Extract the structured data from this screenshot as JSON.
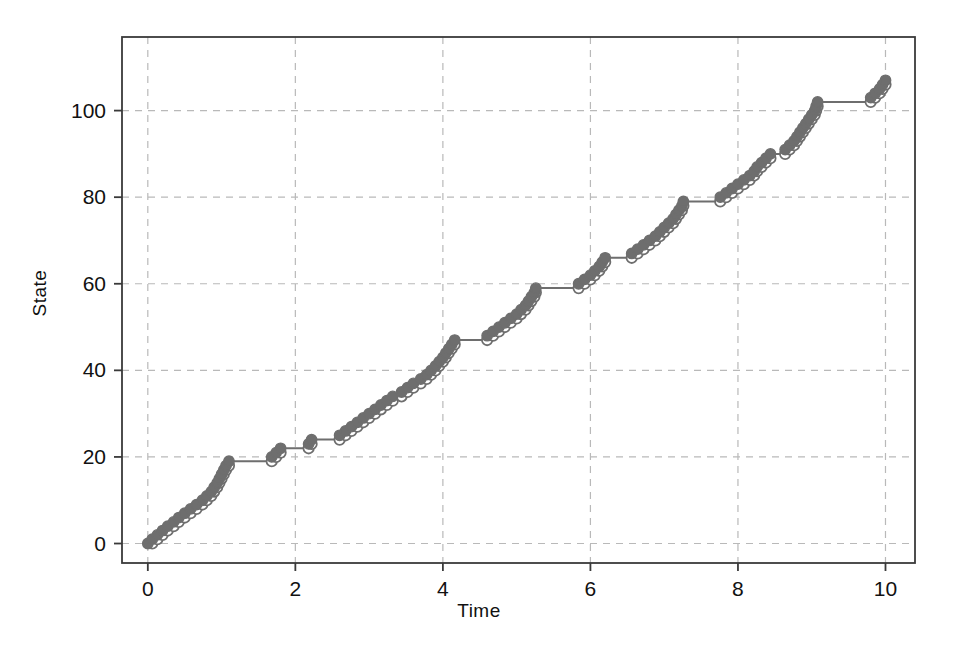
{
  "chart_data": {
    "type": "line",
    "subtype": "step-post",
    "title": "",
    "xlabel": "Time",
    "ylabel": "State",
    "xlim": [
      -0.35,
      10.4
    ],
    "ylim": [
      -4.5,
      117
    ],
    "xticks": [
      0,
      2,
      4,
      6,
      8,
      10
    ],
    "yticks": [
      0,
      20,
      40,
      60,
      80,
      100
    ],
    "xtick_labels": [
      "0",
      "2",
      "4",
      "6",
      "8",
      "10"
    ],
    "ytick_labels": [
      "0",
      "20",
      "40",
      "60",
      "80",
      "100"
    ],
    "grid": true,
    "grid_style": "dashed",
    "grid_color": "#b9b9b9",
    "frame_color": "#3a3a3a",
    "legend": null,
    "series": [
      {
        "name": "State",
        "color": "#6e6e6e",
        "marker_filled": "closed-circle",
        "marker_open": "open-circle",
        "line_width": 2,
        "x": [
          0.0,
          0.06,
          0.13,
          0.2,
          0.27,
          0.35,
          0.42,
          0.5,
          0.58,
          0.66,
          0.74,
          0.8,
          0.86,
          0.9,
          0.94,
          0.97,
          1.0,
          1.03,
          1.06,
          1.1,
          1.68,
          1.74,
          1.8,
          2.18,
          2.22,
          2.6,
          2.68,
          2.76,
          2.84,
          2.92,
          3.0,
          3.08,
          3.16,
          3.24,
          3.32,
          3.44,
          3.52,
          3.6,
          3.7,
          3.78,
          3.84,
          3.9,
          3.95,
          4.0,
          4.04,
          4.08,
          4.12,
          4.16,
          4.6,
          4.68,
          4.76,
          4.84,
          4.92,
          5.0,
          5.06,
          5.12,
          5.16,
          5.2,
          5.24,
          5.26,
          5.84,
          5.92,
          6.0,
          6.06,
          6.12,
          6.16,
          6.2,
          6.56,
          6.64,
          6.72,
          6.8,
          6.88,
          6.94,
          7.0,
          7.06,
          7.12,
          7.16,
          7.2,
          7.24,
          7.26,
          7.76,
          7.84,
          7.92,
          8.0,
          8.08,
          8.16,
          8.22,
          8.26,
          8.32,
          8.38,
          8.44,
          8.64,
          8.7,
          8.76,
          8.8,
          8.84,
          8.88,
          8.92,
          8.96,
          9.0,
          9.04,
          9.06,
          9.08,
          9.8,
          9.86,
          9.92,
          9.96,
          10.0
        ],
        "y": [
          0,
          1,
          2,
          3,
          4,
          5,
          6,
          7,
          8,
          9,
          10,
          11,
          12,
          13,
          14,
          15,
          16,
          17,
          18,
          19,
          20,
          21,
          22,
          23,
          24,
          25,
          26,
          27,
          28,
          29,
          30,
          31,
          32,
          33,
          34,
          35,
          36,
          37,
          38,
          39,
          40,
          41,
          42,
          43,
          44,
          45,
          46,
          47,
          48,
          49,
          50,
          51,
          52,
          53,
          54,
          55,
          56,
          57,
          58,
          59,
          60,
          61,
          62,
          63,
          64,
          65,
          66,
          67,
          68,
          69,
          70,
          71,
          72,
          73,
          74,
          75,
          76,
          77,
          78,
          79,
          80,
          81,
          82,
          83,
          84,
          85,
          86,
          87,
          88,
          89,
          90,
          91,
          92,
          93,
          94,
          95,
          96,
          97,
          98,
          99,
          100,
          101,
          102,
          103,
          104,
          105,
          106,
          107
        ],
        "plateaus": [
          {
            "from_x": 1.1,
            "to_x": 1.68,
            "y": 19
          },
          {
            "from_x": 1.8,
            "to_x": 2.18,
            "y": 22
          },
          {
            "from_x": 2.22,
            "to_x": 2.6,
            "y": 24
          },
          {
            "from_x": 3.32,
            "to_x": 3.44,
            "y": 34
          },
          {
            "from_x": 4.16,
            "to_x": 4.6,
            "y": 47
          },
          {
            "from_x": 5.26,
            "to_x": 5.84,
            "y": 59
          },
          {
            "from_x": 6.2,
            "to_x": 6.56,
            "y": 66
          },
          {
            "from_x": 7.26,
            "to_x": 7.76,
            "y": 79
          },
          {
            "from_x": 8.44,
            "to_x": 8.64,
            "y": 90
          },
          {
            "from_x": 9.08,
            "to_x": 9.8,
            "y": 102
          }
        ],
        "final_value": 107,
        "start_value": 0
      }
    ]
  },
  "axes": {
    "x_title": "Time",
    "y_title": "State"
  }
}
